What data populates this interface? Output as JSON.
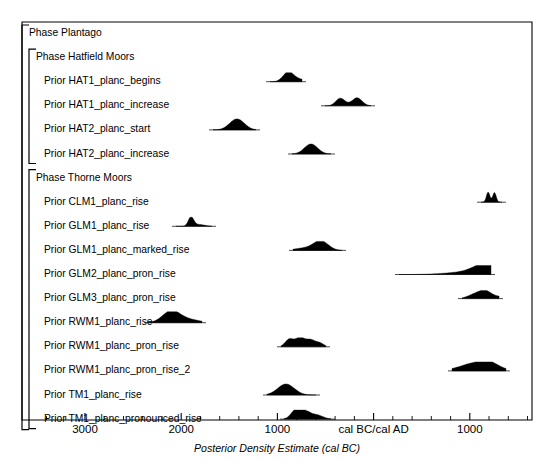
{
  "figure": {
    "axis_title": "Posterior Density Estimate (cal BC)",
    "frame_color": "#000000",
    "density_color": "#000000",
    "background": "#ffffff"
  },
  "chart_data": {
    "type": "area",
    "title": "",
    "xlabel": "Posterior Density Estimate (cal BC)",
    "ylabel": "",
    "grid": false,
    "legend": null,
    "xlim": [
      3500,
      -1700
    ],
    "x_axis_note": "values are cal BC positive, cal AD negative; axis runs oldest (left) to youngest (right)",
    "tick_labels": [
      "3000",
      "2000",
      "1000",
      "cal BC/cal AD",
      "1000"
    ],
    "tick_values": [
      3000,
      2000,
      1000,
      0,
      -1000
    ],
    "minor_tick_interval": 200,
    "groups": [
      {
        "level": 0,
        "label": "Phase Plantago",
        "bracket": true
      },
      {
        "level": 1,
        "label": "Phase Hatfield Moors",
        "bracket": true,
        "rows": [
          {
            "label": "Prior HAT1_planc_begins",
            "range_cal_bc": [
              1180,
              870
            ],
            "peak_cal_bc": 1000,
            "shape": "unimodal-right-tail",
            "px_span": [
              270,
              302
            ],
            "px_peak": 288,
            "height_px": 9
          },
          {
            "label": "Prior HAT1_planc_increase",
            "range_cal_bc": [
              620,
              150
            ],
            "peak_cal_bc": 430,
            "shape": "bimodal",
            "px_span": [
              325,
              371
            ],
            "px_peak": 345,
            "height_px": 8
          },
          {
            "label": "Prior HAT2_planc_start",
            "range_cal_bc": [
              1630,
              1190
            ],
            "peak_cal_bc": 1390,
            "shape": "unimodal",
            "px_span": [
              213,
              256
            ],
            "px_peak": 237,
            "height_px": 11
          },
          {
            "label": "Prior HAT2_planc_increase",
            "range_cal_bc": [
              820,
              420
            ],
            "peak_cal_bc": 620,
            "shape": "unimodal",
            "px_span": [
              292,
              331
            ],
            "px_peak": 311,
            "height_px": 10
          }
        ]
      },
      {
        "level": 1,
        "label": "Phase Thorne Moors",
        "bracket": true,
        "rows": [
          {
            "label": "Prior CLM1_planc_rise",
            "range_cal_bc": [
              -1150,
              -1330
            ],
            "peak_cal_bc": -1230,
            "shape": "narrow-bimodal",
            "px_span": [
              481,
              502
            ],
            "px_peak": 491,
            "height_px": 10
          },
          {
            "label": "Prior GLM1_planc_rise",
            "range_cal_bc": [
              2080,
              1730
            ],
            "peak_cal_bc": 1950,
            "shape": "narrow-peak",
            "px_span": [
              176,
              212
            ],
            "px_peak": 191,
            "height_px": 9
          },
          {
            "label": "Prior GLM1_planc_marked_rise",
            "range_cal_bc": [
              860,
              390
            ],
            "peak_cal_bc": 530,
            "shape": "unimodal-left-tail",
            "px_span": [
              293,
              342
            ],
            "px_peak": 321,
            "height_px": 9
          },
          {
            "label": "Prior GLM2_planc_pron_rise",
            "range_cal_bc": [
              -310,
              -1130
            ],
            "peak_cal_bc": -1040,
            "shape": "long-left-tail",
            "px_span": [
              399,
              491
            ],
            "px_peak": 479,
            "height_px": 9
          },
          {
            "label": "Prior GLM3_planc_pron_rise",
            "range_cal_bc": [
              -970,
              -1340
            ],
            "peak_cal_bc": -1210,
            "shape": "skewed",
            "px_span": [
              462,
              499
            ],
            "px_peak": 485,
            "height_px": 8
          },
          {
            "label": "Prior RWM1_planc_rise",
            "range_cal_bc": [
              2320,
              1800
            ],
            "peak_cal_bc": 2180,
            "shape": "unimodal-right-tail",
            "px_span": [
              148,
              202
            ],
            "px_peak": 171,
            "height_px": 11
          },
          {
            "label": "Prior RWM1_planc_pron_rise",
            "range_cal_bc": [
              980,
              530
            ],
            "peak_cal_bc": 810,
            "shape": "multimodal",
            "px_span": [
              281,
              326
            ],
            "px_peak": 301,
            "height_px": 9
          },
          {
            "label": "Prior RWM1_planc_pron_rise_2",
            "range_cal_bc": [
              -850,
              -1390
            ],
            "peak_cal_bc": -1120,
            "shape": "broad-flat",
            "px_span": [
              452,
              506
            ],
            "px_peak": 478,
            "height_px": 9
          },
          {
            "label": "Prior TM1_planc_rise",
            "range_cal_bc": [
              1060,
              570
            ],
            "peak_cal_bc": 880,
            "shape": "unimodal",
            "px_span": [
              267,
              316
            ],
            "px_peak": 286,
            "height_px": 11
          },
          {
            "label": "Prior TM1_planc_pronounced_rise",
            "range_cal_bc": [
              890,
              440
            ],
            "peak_cal_bc": 720,
            "shape": "multimodal-right-tail",
            "px_span": [
              284,
              331
            ],
            "px_peak": 299,
            "height_px": 9
          }
        ]
      }
    ]
  }
}
